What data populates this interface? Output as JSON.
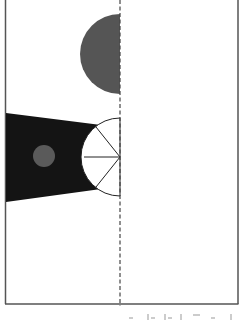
{
  "diagram": {
    "background": "#ffffff",
    "frame": {
      "x": 5,
      "y": 0,
      "width": 233,
      "height": 304,
      "stroke": "#555555"
    },
    "divider": {
      "x": 120,
      "stroke": "#444444",
      "style": "dashed"
    },
    "half_circle": {
      "cx": 120,
      "cy": 54,
      "r": 40,
      "fill": "#555555"
    },
    "dark_beam": {
      "fill": "#141414"
    },
    "small_circle": {
      "cx": 44,
      "cy": 156,
      "r": 11,
      "fill": "#5a5a5a"
    },
    "fan": {
      "cx": 120,
      "cy": 157,
      "r": 38,
      "stroke": "#222222",
      "fill": "#ffffff"
    },
    "bottom_marks_color": "#888888"
  }
}
